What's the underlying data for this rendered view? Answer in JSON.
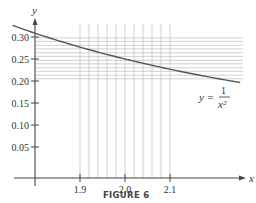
{
  "chart_data": {
    "type": "line",
    "title": "",
    "caption": "FIGURE 6",
    "xlabel": "x",
    "ylabel": "y",
    "curve_label": {
      "lhs": "y =",
      "numerator": "1",
      "denominator": "x²"
    },
    "function": "y = 1/x^2",
    "xlim": [
      1.75,
      2.26
    ],
    "ylim": [
      0,
      0.33
    ],
    "x_ticks": [
      1.9,
      2.0,
      2.1
    ],
    "x_tick_labels": [
      "1.9",
      "2.0",
      "2.1"
    ],
    "y_ticks": [
      0.05,
      0.1,
      0.15,
      0.2,
      0.25,
      0.3
    ],
    "y_tick_labels": [
      "0.05",
      "0.10",
      "0.15",
      "0.20",
      "0.25",
      "0.30"
    ],
    "vertical_gridlines_x": [
      1.9,
      1.92,
      1.94,
      1.96,
      1.98,
      2.0,
      2.02,
      2.04,
      2.06,
      2.08,
      2.1
    ],
    "horizontal_gridlines_y": [
      0.298,
      0.29,
      0.281,
      0.273,
      0.264,
      0.256,
      0.247,
      0.239,
      0.23,
      0.222,
      0.213,
      0.205
    ],
    "series": [
      {
        "name": "y = 1/x^2",
        "x": [
          1.75,
          1.8,
          1.85,
          1.9,
          1.95,
          2.0,
          2.05,
          2.1,
          2.15,
          2.2,
          2.256
        ],
        "y": [
          0.3265,
          0.3086,
          0.2922,
          0.277,
          0.263,
          0.25,
          0.238,
          0.2268,
          0.2163,
          0.2066,
          0.1965
        ]
      }
    ],
    "grid": true,
    "legend": "none"
  },
  "colors": {
    "axis": "#444444",
    "curve": "#555555",
    "grid": "#bdbdbd",
    "text": "#333333"
  }
}
